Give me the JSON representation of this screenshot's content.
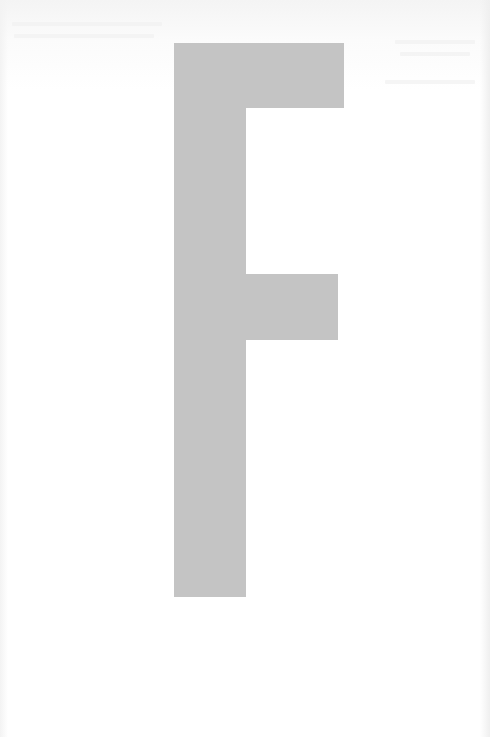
{
  "page": {
    "background": "#ffffff",
    "letter": {
      "character": "F",
      "color": "#c4c4c4",
      "parts": {
        "stem": {
          "x": 174,
          "y": 43,
          "width": 72,
          "height": 554
        },
        "top_arm": {
          "x": 174,
          "y": 43,
          "width": 170,
          "height": 65
        },
        "middle_arm": {
          "x": 174,
          "y": 274,
          "width": 164,
          "height": 66
        }
      }
    }
  }
}
